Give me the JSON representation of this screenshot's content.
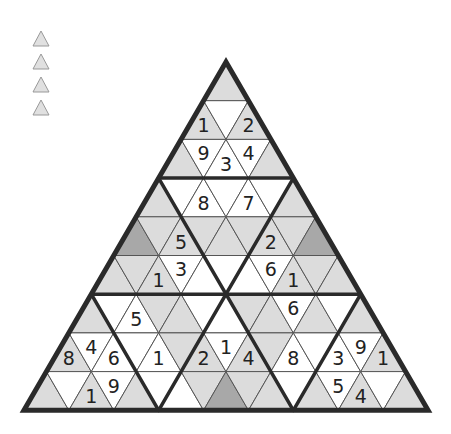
{
  "legend": {
    "items": [
      {
        "name": "triangle-icon-1"
      },
      {
        "name": "triangle-icon-2"
      },
      {
        "name": "triangle-icon-3"
      },
      {
        "name": "triangle-icon-4"
      }
    ]
  },
  "colors": {
    "light": "#dcdcdc",
    "white": "#ffffff",
    "dark": "#a8a8a8",
    "line": "#555555",
    "border": "#2a2a2a"
  },
  "board": {
    "apex": [
      226,
      62
    ],
    "rows": 9,
    "cell_width": 44.9,
    "row_height": 38.7,
    "grid": [
      [
        [
          "L",
          ""
        ]
      ],
      [
        [
          "L",
          "1"
        ],
        [
          "W",
          ""
        ],
        [
          "L",
          "2"
        ]
      ],
      [
        [
          "L",
          ""
        ],
        [
          "W",
          "9"
        ],
        [
          "W",
          "3"
        ],
        [
          "W",
          "4"
        ],
        [
          "L",
          ""
        ]
      ],
      [
        [
          "L",
          ""
        ],
        [
          "W",
          ""
        ],
        [
          "W",
          "8"
        ],
        [
          "W",
          ""
        ],
        [
          "W",
          "7"
        ],
        [
          "W",
          ""
        ],
        [
          "L",
          ""
        ]
      ],
      [
        [
          "D",
          ""
        ],
        [
          "L",
          ""
        ],
        [
          "L",
          "5"
        ],
        [
          "L",
          ""
        ],
        [
          "L",
          ""
        ],
        [
          "L",
          ""
        ],
        [
          "L",
          "2"
        ],
        [
          "L",
          ""
        ],
        [
          "D",
          ""
        ]
      ],
      [
        [
          "L",
          ""
        ],
        [
          "L",
          ""
        ],
        [
          "L",
          "1"
        ],
        [
          "W",
          "3"
        ],
        [
          "W",
          ""
        ],
        [
          "W",
          ""
        ],
        [
          "W",
          ""
        ],
        [
          "W",
          "6"
        ],
        [
          "L",
          "1"
        ],
        [
          "L",
          ""
        ],
        [
          "L",
          ""
        ]
      ],
      [
        [
          "L",
          ""
        ],
        [
          "W",
          ""
        ],
        [
          "W",
          "5"
        ],
        [
          "L",
          ""
        ],
        [
          "L",
          ""
        ],
        [
          "W",
          ""
        ],
        [
          "W",
          ""
        ],
        [
          "L",
          ""
        ],
        [
          "L",
          ""
        ],
        [
          "W",
          "6"
        ],
        [
          "L",
          ""
        ],
        [
          "W",
          ""
        ],
        [
          "L",
          ""
        ]
      ],
      [
        [
          "L",
          "8"
        ],
        [
          "W",
          "4"
        ],
        [
          "W",
          "6"
        ],
        [
          "W",
          ""
        ],
        [
          "W",
          "1"
        ],
        [
          "L",
          ""
        ],
        [
          "L",
          "2"
        ],
        [
          "W",
          "1"
        ],
        [
          "L",
          "4"
        ],
        [
          "L",
          ""
        ],
        [
          "W",
          "8"
        ],
        [
          "W",
          ""
        ],
        [
          "W",
          "3"
        ],
        [
          "W",
          "9"
        ],
        [
          "L",
          "1"
        ]
      ],
      [
        [
          "L",
          ""
        ],
        [
          "W",
          ""
        ],
        [
          "L",
          "1"
        ],
        [
          "W",
          "9"
        ],
        [
          "L",
          ""
        ],
        [
          "W",
          ""
        ],
        [
          "W",
          ""
        ],
        [
          "L",
          ""
        ],
        [
          "D",
          ""
        ],
        [
          "L",
          ""
        ],
        [
          "L",
          ""
        ],
        [
          "W",
          ""
        ],
        [
          "L",
          ""
        ],
        [
          "W",
          "5"
        ],
        [
          "L",
          "4"
        ],
        [
          "W",
          ""
        ],
        [
          "L",
          ""
        ]
      ]
    ],
    "labels": {
      "r1c0": "1",
      "r1c2": "2",
      "r2c1": "9",
      "r2c2": "3",
      "r2c3": "4",
      "r3c2": "8",
      "r3c4": "7",
      "r4c3": "5",
      "r4c7": "2",
      "r5c2": "1",
      "r5c3": "3",
      "r5c7": "6",
      "r5c8": "1",
      "r6c2": "5",
      "r6c10": "6",
      "r7c0": "8",
      "r7c1": "4",
      "r7c2": "6",
      "r7c4": "1",
      "r7c6": "2",
      "r7c7": "1",
      "r7c8": "4",
      "r7c10": "8",
      "r7c12": "3",
      "r7c13": "9",
      "r7c14": "1",
      "r8c2": "1",
      "r8c3": "9",
      "r8c13": "5",
      "r8c14": "4"
    }
  }
}
